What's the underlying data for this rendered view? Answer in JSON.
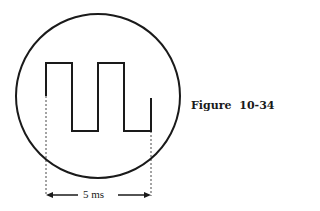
{
  "figure": {
    "caption": "Figure  10-34"
  },
  "dimension": {
    "label": "5 ms",
    "spans": "two full periods of the waveform"
  },
  "waveform": {
    "type": "square",
    "periods_shown": 2,
    "period_ms": 2.5
  },
  "colors": {
    "ink": "#1a1a1a",
    "background": "#ffffff"
  }
}
